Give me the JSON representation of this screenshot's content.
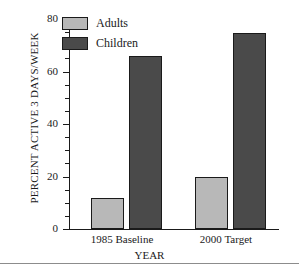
{
  "chart_data": {
    "type": "bar",
    "title": "",
    "xlabel": "YEAR",
    "ylabel": "PERCENT ACTIVE 3 DAYS/WEEK",
    "categories": [
      "1985 Baseline",
      "2000 Target"
    ],
    "series": [
      {
        "name": "Adults",
        "values": [
          12,
          20
        ],
        "color": "#b8b8b8"
      },
      {
        "name": "Children",
        "values": [
          66,
          74.5
        ],
        "color": "#4a4a4a"
      }
    ],
    "ylim": [
      0,
      80
    ],
    "yticks": [
      0,
      20,
      40,
      60,
      80
    ],
    "ytick_labels": [
      "0",
      "20",
      "40",
      "60",
      "80"
    ],
    "yminor_step": 5,
    "grid": false,
    "legend_position": "top-left",
    "axis_color": "#1a1a1a",
    "background": "#ffffff"
  },
  "legend": {
    "items": [
      {
        "label": "Adults"
      },
      {
        "label": "Children"
      }
    ]
  },
  "axes": {
    "y_title": "PERCENT ACTIVE 3 DAYS/WEEK",
    "x_title": "YEAR",
    "y_labels": [
      "80",
      "60",
      "40",
      "20",
      "0"
    ],
    "x_labels": [
      "1985 Baseline",
      "2000 Target"
    ]
  }
}
